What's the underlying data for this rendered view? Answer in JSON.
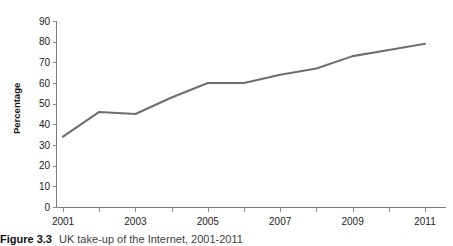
{
  "caption": {
    "label": "Figure 3.3",
    "text": "UK take-up of the Internet, 2001-2011"
  },
  "chart_data": {
    "type": "line",
    "title": "",
    "xlabel": "",
    "ylabel": "Percentage",
    "x": [
      2001,
      2002,
      2003,
      2004,
      2005,
      2006,
      2007,
      2008,
      2009,
      2010,
      2011
    ],
    "values": [
      34,
      46,
      45,
      53,
      60,
      60,
      64,
      67,
      73,
      76,
      79
    ],
    "series": [
      {
        "name": "UK take-up of the Internet",
        "values": [
          34,
          46,
          45,
          53,
          60,
          60,
          64,
          67,
          73,
          76,
          79
        ]
      }
    ],
    "xlim": [
      2001,
      2011
    ],
    "ylim": [
      0,
      90
    ],
    "xticks": [
      2001,
      2002,
      2003,
      2004,
      2005,
      2006,
      2007,
      2008,
      2009,
      2010,
      2011
    ],
    "xtick_labels": [
      "2001",
      "",
      "2003",
      "",
      "2005",
      "",
      "2007",
      "",
      "2009",
      "",
      "2011"
    ],
    "xtick_labels_shown": [
      "2001",
      "2003",
      "2005",
      "2007",
      "2009",
      "2011"
    ],
    "yticks": [
      0,
      10,
      20,
      30,
      40,
      50,
      60,
      70,
      80,
      90
    ],
    "ytick_labels": [
      "0",
      "10",
      "20",
      "30",
      "40",
      "50",
      "60",
      "70",
      "80",
      "90"
    ],
    "grid": false,
    "legend": false,
    "legend_position": "none",
    "line_color": "#6e6e6e",
    "axis_color": "#7a7a7a"
  }
}
